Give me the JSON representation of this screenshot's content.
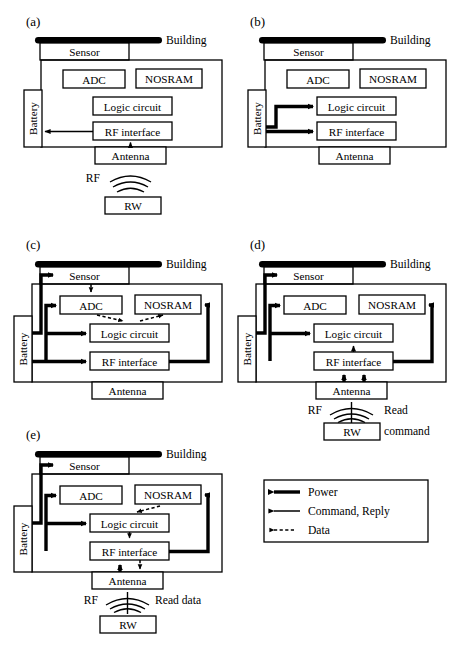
{
  "figure": {
    "type": "block-diagram",
    "panel_count": 5,
    "blocks": {
      "sensor": "Sensor",
      "adc": "ADC",
      "nosram": "NOSRAM",
      "logic": "Logic circuit",
      "rf": "RF interface",
      "antenna": "Antenna",
      "battery": "Battery",
      "rw": "RW",
      "building": "Building",
      "rf_label": "RF"
    },
    "panels": [
      {
        "tag": "(a)",
        "name": "panel-a",
        "has_rw": true,
        "rw_caption": "",
        "arrows": [
          "antenna-to-rf (command)",
          "rf-to-battery (command)"
        ]
      },
      {
        "tag": "(b)",
        "name": "panel-b",
        "has_rw": false,
        "rw_caption": "",
        "arrows": [
          "battery-to-logic (power)",
          "battery-to-rf (power)"
        ]
      },
      {
        "tag": "(c)",
        "name": "panel-c",
        "has_rw": false,
        "rw_caption": "",
        "arrows": [
          "battery-to-sensor (power)",
          "battery-to-adc (power)",
          "battery-to-logic (power)",
          "battery-to-rf (power)",
          "rf-to-nosram (power)",
          "sensor-to-adc (data)",
          "adc-to-logic (data)",
          "logic-to-nosram (data)"
        ]
      },
      {
        "tag": "(d)",
        "name": "panel-d",
        "has_rw": true,
        "rw_caption_line1": "Read",
        "rw_caption_line2": "command",
        "arrows": [
          "battery-to-sensor (power)",
          "battery-to-adc (power)",
          "battery-to-logic (power)",
          "rf-to-nosram (power)",
          "rf-to-logic (command)",
          "antenna-to-rf (command x2)"
        ]
      },
      {
        "tag": "(e)",
        "name": "panel-e",
        "has_rw": true,
        "rw_caption": "Read data",
        "arrows": [
          "battery-to-sensor (power)",
          "battery-to-adc (power)",
          "battery-to-logic (power)",
          "rf-to-nosram (power)",
          "nosram-to-logic (data)",
          "logic-to-rf (data)",
          "antenna-to-rf (command)",
          "rf-to-antenna (data)"
        ]
      }
    ]
  },
  "legend": {
    "title": "",
    "items": [
      {
        "label": "Power",
        "style": "thick-solid-arrow"
      },
      {
        "label": "Command, Reply",
        "style": "thin-solid-arrow"
      },
      {
        "label": "Data",
        "style": "thin-dashed-arrow"
      }
    ]
  },
  "colors": {
    "stroke": "#000000",
    "fill": "#ffffff",
    "building": "#000000"
  }
}
